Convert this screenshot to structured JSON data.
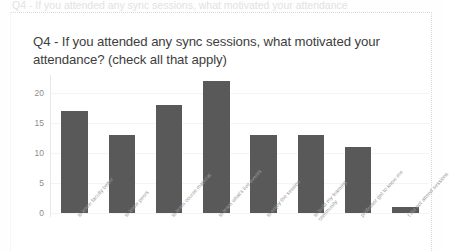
{
  "page": {
    "top_cut_text": "Q4 - If you attended any sync sessions, what motivated your attendance"
  },
  "chart_data": {
    "type": "bar",
    "title": "Q4 - If you attended any sync sessions, what motivated your attendance? (check all that apply)",
    "xlabel": "",
    "ylabel": "",
    "ylim": [
      0,
      22
    ],
    "yticks": [
      "0",
      "5",
      "10",
      "15",
      "20"
    ],
    "grid": true,
    "legend": "none",
    "bar_color": "#595959",
    "categories": [
      "to know faculty better",
      "to know peers",
      "to learn course material",
      "to learn what's live events",
      "to enjoy the session",
      "to build my learning community",
      "professor get to know me",
      "I did not attend sessions"
    ],
    "values": [
      17,
      13,
      18,
      22,
      13,
      13,
      11,
      1
    ]
  }
}
